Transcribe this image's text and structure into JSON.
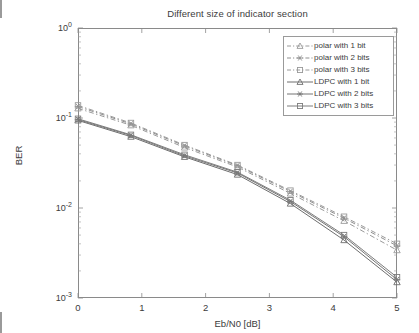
{
  "chart_data": {
    "type": "line",
    "title": "Different size of indicator section",
    "xlabel": "Eb/N0 [dB]",
    "ylabel": "BER",
    "xlim": [
      0,
      5
    ],
    "ylim": [
      0.001,
      1
    ],
    "yscale": "log",
    "xticks": [
      "0",
      "1",
      "2",
      "3",
      "4",
      "5"
    ],
    "yticks": [
      "10^0",
      "10^-1",
      "10^-2",
      "10^-3"
    ],
    "ytick_labels": [
      {
        "mantissa": "10",
        "exponent": "0"
      },
      {
        "mantissa": "10",
        "exponent": "-1"
      },
      {
        "mantissa": "10",
        "exponent": "-2"
      },
      {
        "mantissa": "10",
        "exponent": "-3"
      }
    ],
    "grid": false,
    "legend_position": "top-right",
    "x": [
      0,
      0.83,
      1.67,
      2.5,
      3.33,
      4.17,
      5
    ],
    "series": [
      {
        "name": "polar with 1 bit",
        "style": "dashed",
        "marker": "triangle",
        "color": "#9a9a9a",
        "values": [
          0.128,
          0.083,
          0.047,
          0.0285,
          0.0145,
          0.0072,
          0.0034
        ]
      },
      {
        "name": "polar with 2 bits",
        "style": "dashed",
        "marker": "asterisk",
        "color": "#8f8f8f",
        "values": [
          0.134,
          0.086,
          0.049,
          0.0295,
          0.0152,
          0.0077,
          0.0038
        ]
      },
      {
        "name": "polar with 3 bits",
        "style": "dashed",
        "marker": "square",
        "color": "#9a9a9a",
        "values": [
          0.138,
          0.088,
          0.05,
          0.03,
          0.0156,
          0.008,
          0.004
        ]
      },
      {
        "name": "LDPC with 1 bit",
        "style": "solid",
        "marker": "triangle",
        "color": "#6e6e6e",
        "values": [
          0.094,
          0.062,
          0.037,
          0.0235,
          0.0112,
          0.0044,
          0.0015
        ]
      },
      {
        "name": "LDPC with 2 bits",
        "style": "solid",
        "marker": "asterisk",
        "color": "#757575",
        "values": [
          0.096,
          0.064,
          0.038,
          0.0245,
          0.0118,
          0.0048,
          0.0016
        ]
      },
      {
        "name": "LDPC with 3 bits",
        "style": "solid",
        "marker": "square",
        "color": "#7d7d7d",
        "values": [
          0.098,
          0.065,
          0.039,
          0.025,
          0.0122,
          0.005,
          0.0017
        ]
      }
    ]
  },
  "legend": {
    "items": [
      {
        "label": "polar with 1 bit"
      },
      {
        "label": "polar with 2 bits"
      },
      {
        "label": "polar with 3 bits"
      },
      {
        "label": "LDPC with 1 bit"
      },
      {
        "label": "LDPC with 2 bits"
      },
      {
        "label": "LDPC with 3 bits"
      }
    ]
  },
  "axis": {
    "x_tick_0": "0",
    "x_tick_1": "1",
    "x_tick_2": "2",
    "x_tick_3": "3",
    "x_tick_4": "4",
    "x_tick_5": "5"
  }
}
